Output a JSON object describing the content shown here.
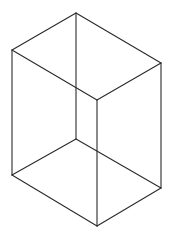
{
  "diagram": {
    "type": "wireframe-cuboid",
    "stroke_color": "#2b2b2b",
    "background": "#ffffff",
    "vertices": {
      "top_back": [
        76,
        13
      ],
      "top_left": [
        12,
        50
      ],
      "top_right": [
        161,
        63
      ],
      "top_front": [
        97,
        100
      ],
      "bottom_back": [
        76,
        139
      ],
      "bottom_left": [
        12,
        175
      ],
      "bottom_right": [
        161,
        188
      ],
      "bottom_front": [
        97,
        226
      ]
    },
    "edges": [
      [
        "top_back",
        "top_left"
      ],
      [
        "top_back",
        "top_right"
      ],
      [
        "top_left",
        "top_front"
      ],
      [
        "top_right",
        "top_front"
      ],
      [
        "bottom_back",
        "bottom_left"
      ],
      [
        "bottom_back",
        "bottom_right"
      ],
      [
        "bottom_left",
        "bottom_front"
      ],
      [
        "bottom_right",
        "bottom_front"
      ],
      [
        "top_back",
        "bottom_back"
      ],
      [
        "top_left",
        "bottom_left"
      ],
      [
        "top_right",
        "bottom_right"
      ],
      [
        "top_front",
        "bottom_front"
      ]
    ]
  }
}
